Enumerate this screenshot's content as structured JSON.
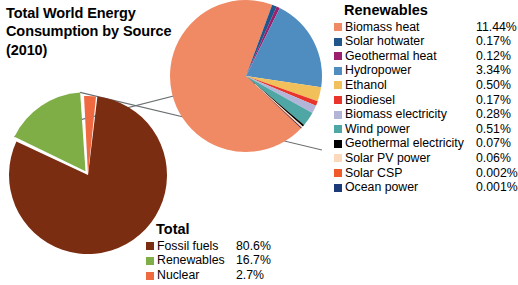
{
  "title": "Total World Energy\nConsumption by Source\n(2010)",
  "renewables_legend": {
    "heading": "Renewables",
    "items": [
      {
        "label": "Biomass heat",
        "value": "11.44%",
        "color": "#f08a65"
      },
      {
        "label": "Solar hotwater",
        "value": "0.17%",
        "color": "#20568c"
      },
      {
        "label": "Geothermal heat",
        "value": "0.12%",
        "color": "#9c1f6e"
      },
      {
        "label": "Hydropower",
        "value": "3.34%",
        "color": "#4f8cc0"
      },
      {
        "label": "Ethanol",
        "value": "0.50%",
        "color": "#f2c05a"
      },
      {
        "label": "Biodiesel",
        "value": "0.17%",
        "color": "#e8342a"
      },
      {
        "label": "Biomass electricity",
        "value": "0.28%",
        "color": "#b3b5d8"
      },
      {
        "label": "Wind power",
        "value": "0.51%",
        "color": "#4fa7a5"
      },
      {
        "label": "Geothermal electricity",
        "value": "0.07%",
        "color": "#000000"
      },
      {
        "label": "Solar PV power",
        "value": "0.06%",
        "color": "#fbd9bd"
      },
      {
        "label": "Solar CSP",
        "value": "0.002%",
        "color": "#ef5a28"
      },
      {
        "label": "Ocean power",
        "value": "0.001%",
        "color": "#1c3a77"
      }
    ]
  },
  "total_legend": {
    "heading": "Total",
    "items": [
      {
        "label": "Fossil fuels",
        "value": "80.6%",
        "color": "#7b2d12"
      },
      {
        "label": "Renewables",
        "value": "16.7%",
        "color": "#7fae46"
      },
      {
        "label": "Nuclear",
        "value": "2.7%",
        "color": "#ef6a41"
      }
    ]
  },
  "chart_data": {
    "type": "pie",
    "title": "Total World Energy Consumption by Source (2010)",
    "charts": [
      {
        "name": "total-energy-pie",
        "legend_position": "bottom-center",
        "categories": [
          "Fossil fuels",
          "Renewables",
          "Nuclear"
        ],
        "values": [
          80.6,
          16.7,
          2.7
        ],
        "unit": "%",
        "colors": [
          "#7b2d12",
          "#7fae46",
          "#ef6a41"
        ]
      },
      {
        "name": "renewables-breakout-pie",
        "legend_position": "right",
        "note": "Exploded detail of the Renewables slice; values are shares of total world energy consumption.",
        "categories": [
          "Biomass heat",
          "Solar hotwater",
          "Geothermal heat",
          "Hydropower",
          "Ethanol",
          "Biodiesel",
          "Biomass electricity",
          "Wind power",
          "Geothermal electricity",
          "Solar PV power",
          "Solar CSP",
          "Ocean power"
        ],
        "values": [
          11.44,
          0.17,
          0.12,
          3.34,
          0.5,
          0.17,
          0.28,
          0.51,
          0.07,
          0.06,
          0.002,
          0.001
        ],
        "unit": "%",
        "colors": [
          "#f08a65",
          "#20568c",
          "#9c1f6e",
          "#4f8cc0",
          "#f2c05a",
          "#e8342a",
          "#b3b5d8",
          "#4fa7a5",
          "#000000",
          "#fbd9bd",
          "#ef5a28",
          "#1c3a77"
        ]
      }
    ]
  }
}
